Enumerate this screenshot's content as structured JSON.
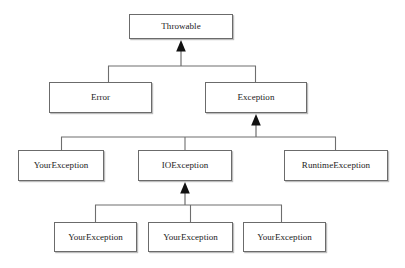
{
  "diagram": {
    "kind": "class-hierarchy",
    "notation": "UML generalization (solid line, hollow-style filled triangle arrowhead pointing to superclass)",
    "canvas": {
      "width": 405,
      "height": 268,
      "background": "#ffffff"
    },
    "style": {
      "box_fill": "#ffffff",
      "box_border": "#6b6b6b",
      "box_shadow": "#bdbdbd",
      "line_color": "#6e6e6e",
      "arrow_color": "#111111",
      "text_color": "#1b1b1b"
    },
    "levels": [
      {
        "level": 1,
        "name": "root",
        "nodes": [
          {
            "id": "throwable",
            "label": "Throwable",
            "x": 129,
            "y": 14,
            "w": 104,
            "h": 25
          }
        ]
      },
      {
        "level": 2,
        "name": "direct-subclasses-of-throwable",
        "nodes": [
          {
            "id": "error",
            "label": "Error",
            "x": 49,
            "y": 82,
            "w": 103,
            "h": 31
          },
          {
            "id": "exception",
            "label": "Exception",
            "x": 205,
            "y": 82,
            "w": 102,
            "h": 31
          }
        ]
      },
      {
        "level": 3,
        "name": "direct-subclasses-of-exception",
        "nodes": [
          {
            "id": "yourexception-l3",
            "label": "YourException",
            "x": 18,
            "y": 150,
            "w": 86,
            "h": 31
          },
          {
            "id": "ioexception",
            "label": "IOException",
            "x": 138,
            "y": 150,
            "w": 94,
            "h": 31
          },
          {
            "id": "runtimeexception",
            "label": "RuntimeException",
            "x": 284,
            "y": 150,
            "w": 104,
            "h": 31
          }
        ]
      },
      {
        "level": 4,
        "name": "direct-subclasses-of-ioexception",
        "nodes": [
          {
            "id": "yourexception-l4-a",
            "label": "YourException",
            "x": 54,
            "y": 222,
            "w": 83,
            "h": 30
          },
          {
            "id": "yourexception-l4-b",
            "label": "YourException",
            "x": 148,
            "y": 222,
            "w": 85,
            "h": 30
          },
          {
            "id": "yourexception-l4-c",
            "label": "YourException",
            "x": 243,
            "y": 222,
            "w": 83,
            "h": 30
          }
        ]
      }
    ],
    "edges": [
      {
        "id": "error-to-throwable",
        "from": "error",
        "to": "throwable",
        "kind": "generalization"
      },
      {
        "id": "exception-to-throwable",
        "from": "exception",
        "to": "throwable",
        "kind": "generalization"
      },
      {
        "id": "yourexception-l3-to-exception",
        "from": "yourexception-l3",
        "to": "exception",
        "kind": "generalization"
      },
      {
        "id": "ioexception-to-exception",
        "from": "ioexception",
        "to": "exception",
        "kind": "generalization"
      },
      {
        "id": "runtimeexception-to-exception",
        "from": "runtimeexception",
        "to": "exception",
        "kind": "generalization"
      },
      {
        "id": "yourexception-l4-a-to-ioexception",
        "from": "yourexception-l4-a",
        "to": "ioexception",
        "kind": "generalization"
      },
      {
        "id": "yourexception-l4-b-to-ioexception",
        "from": "yourexception-l4-b",
        "to": "ioexception",
        "kind": "generalization"
      },
      {
        "id": "yourexception-l4-c-to-ioexception",
        "from": "yourexception-l4-c",
        "to": "ioexception",
        "kind": "generalization"
      }
    ],
    "buses": [
      {
        "id": "bus-throwable",
        "y": 66,
        "x1": 108,
        "x2": 256,
        "arrow_x": 181,
        "arrow_tip_y": 41,
        "stem_from_y": 66
      },
      {
        "id": "bus-exception",
        "y": 137,
        "x1": 61,
        "x2": 336,
        "arrow_x": 256,
        "arrow_tip_y": 115,
        "stem_from_y": 137
      },
      {
        "id": "bus-ioexception",
        "y": 205,
        "x1": 95,
        "x2": 282,
        "arrow_x": 185,
        "arrow_tip_y": 183,
        "stem_from_y": 205
      }
    ]
  }
}
